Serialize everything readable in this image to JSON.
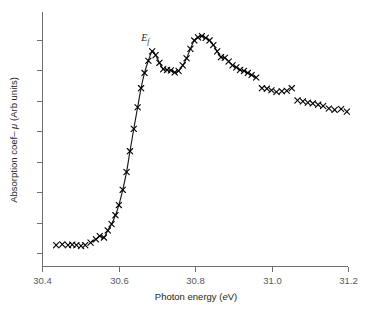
{
  "chart_data": {
    "type": "scatter",
    "title": "",
    "xlabel": "Photon energy (eV)",
    "xlabel_plain": "Photon energy (",
    "xlabel_italic": "e",
    "xlabel_tail": "V)",
    "ylabel": "Absorption coef– μ (Arb units)",
    "ylabel_plain": "Absorption coef– ",
    "ylabel_italic": "μ",
    "ylabel_tail": " (Arb units)",
    "xlim": [
      30.4,
      31.2
    ],
    "ylim": [
      0.0,
      1.0
    ],
    "xticks": [
      30.4,
      30.6,
      30.8,
      31.0,
      31.2
    ],
    "xticklabels": [
      "30.4",
      "30.6",
      "30.8",
      "31.0",
      "31.2"
    ],
    "yticks": [
      0.05,
      0.17,
      0.29,
      0.41,
      0.53,
      0.65,
      0.77,
      0.89
    ],
    "yticklabels": [
      "",
      "",
      "",
      "",
      "",
      "",
      "",
      ""
    ],
    "grid": false,
    "legend": null,
    "marker_symbol": "x",
    "marker_color": "#000000",
    "line_color": "#1a1a1a",
    "axis_color": "#6d6e71",
    "annotations": [
      {
        "name": "fermi-level-label",
        "text": "Ef",
        "base": "E",
        "subscript": "f",
        "x": 30.67,
        "y": 0.885
      }
    ],
    "series": [
      {
        "name": "Absorption spectrum (measured points)",
        "marker": "x",
        "x": [
          30.437,
          30.453,
          30.468,
          30.479,
          30.49,
          30.502,
          30.513,
          30.527,
          30.541,
          30.551,
          30.562,
          30.572,
          30.582,
          30.592,
          30.601,
          30.611,
          30.621,
          30.63,
          30.64,
          30.65,
          30.659,
          30.668,
          30.678,
          30.688,
          30.697,
          30.707,
          30.717,
          30.727,
          30.737,
          30.747,
          30.757,
          30.768,
          30.778,
          30.788,
          30.798,
          30.808,
          30.818,
          30.828,
          30.838,
          30.848,
          30.858,
          30.868,
          30.878,
          30.888,
          30.898,
          30.908,
          30.918,
          30.928,
          30.938,
          30.948,
          30.96,
          30.975,
          30.988,
          31.0,
          31.013,
          31.027,
          31.04,
          31.053,
          31.068,
          31.082,
          31.095,
          31.108,
          31.122,
          31.135,
          31.15,
          31.165,
          31.182,
          31.197
        ],
        "y": [
          0.082,
          0.085,
          0.082,
          0.084,
          0.082,
          0.079,
          0.082,
          0.092,
          0.105,
          0.118,
          0.112,
          0.14,
          0.165,
          0.2,
          0.24,
          0.3,
          0.37,
          0.452,
          0.54,
          0.625,
          0.7,
          0.76,
          0.808,
          0.845,
          0.83,
          0.8,
          0.775,
          0.772,
          0.77,
          0.762,
          0.768,
          0.79,
          0.818,
          0.855,
          0.888,
          0.9,
          0.905,
          0.898,
          0.888,
          0.87,
          0.845,
          0.822,
          0.82,
          0.805,
          0.79,
          0.782,
          0.772,
          0.768,
          0.76,
          0.752,
          0.742,
          0.7,
          0.698,
          0.692,
          0.685,
          0.688,
          0.69,
          0.7,
          0.652,
          0.648,
          0.643,
          0.64,
          0.635,
          0.63,
          0.62,
          0.615,
          0.618,
          0.608
        ],
        "fitted_line_range": [
          30.527,
          30.96
        ]
      }
    ]
  },
  "figure": {
    "background": "#ffffff",
    "axis_stroke": "#6d6e71",
    "text_color": "#231f20",
    "tick_text_color": "#58595b"
  }
}
